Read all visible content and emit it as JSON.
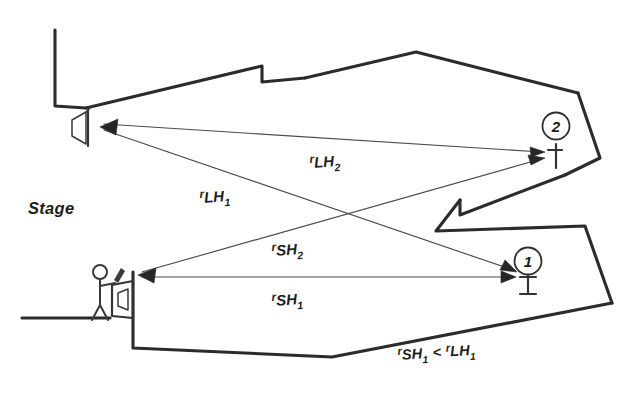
{
  "diagram": {
    "background_color": "#ffffff",
    "ink_color": "#2b2b2b",
    "labels": {
      "stage": "Stage",
      "r_lh2": {
        "pre": "r",
        "main": "LH",
        "sub": "2"
      },
      "r_lh1": {
        "pre": "r",
        "main": "LH",
        "sub": "1"
      },
      "r_sh2": {
        "pre": "r",
        "main": "SH",
        "sub": "2"
      },
      "r_sh1": {
        "pre": "r",
        "main": "SH",
        "sub": "1"
      },
      "inequality": {
        "left_pre": "r",
        "left_main": "SH",
        "left_sub": "1",
        "operator": "<",
        "right_pre": "r",
        "right_main": "LH",
        "right_sub": "1"
      }
    },
    "markers": [
      {
        "id": "listener-position-1",
        "label": "1",
        "cx": 528,
        "cy": 261,
        "r": 13.5
      },
      {
        "id": "listener-position-2",
        "label": "2",
        "cx": 556,
        "cy": 126,
        "r": 13.5
      }
    ],
    "sources": [
      {
        "id": "overhead-loudspeaker",
        "name": "loudspeaker",
        "x": 88,
        "y": 122
      },
      {
        "id": "stage-talker",
        "name": "talker-with-microphone",
        "x": 117,
        "y": 288
      }
    ],
    "rays": [
      {
        "id": "r-lh2",
        "from": "overhead-loudspeaker",
        "to": "listener-position-2",
        "label": "r_LH2"
      },
      {
        "id": "r-lh1",
        "from": "overhead-loudspeaker",
        "to": "listener-position-1",
        "label": "r_LH1"
      },
      {
        "id": "r-sh2",
        "from": "stage-talker",
        "to": "listener-position-2",
        "label": "r_SH2"
      },
      {
        "id": "r-sh1",
        "from": "stage-talker",
        "to": "listener-position-1",
        "label": "r_SH1"
      }
    ]
  }
}
